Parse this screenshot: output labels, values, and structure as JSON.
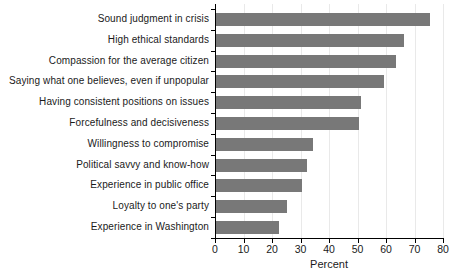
{
  "chart_data": {
    "type": "bar",
    "orientation": "horizontal",
    "categories": [
      "Sound judgment in crisis",
      "High ethical standards",
      "Compassion for the average citizen",
      "Saying what one believes, even if unpopular",
      "Having consistent positions on issues",
      "Forcefulness and decisiveness",
      "Willingness to compromise",
      "Political savvy and know-how",
      "Experience in public office",
      "Loyalty to one's party",
      "Experience in Washington"
    ],
    "values": [
      75,
      66,
      63,
      59,
      51,
      50,
      34,
      32,
      30,
      25,
      22
    ],
    "title": "",
    "xlabel": "Percent",
    "ylabel": "",
    "xlim": [
      0,
      80
    ],
    "xticks": [
      0,
      10,
      20,
      30,
      40,
      50,
      60,
      70,
      80
    ],
    "grid": "vertical-light",
    "legend": "none",
    "colors": {
      "bar": "#787878",
      "gridline": "#e9e9e9",
      "axis": "#000000",
      "text": "#1a1a1a",
      "background": "#ffffff"
    }
  }
}
